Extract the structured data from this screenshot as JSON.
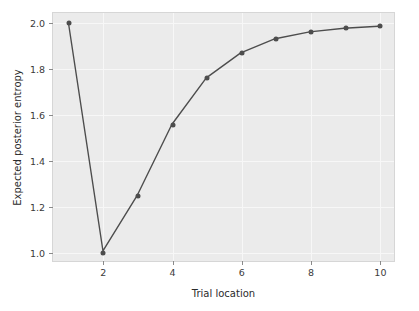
{
  "chart_data": {
    "type": "line",
    "title": "",
    "xlabel": "Trial location",
    "ylabel": "Expected posterior entropy",
    "x": [
      1,
      2,
      3,
      4,
      5,
      6,
      7,
      8,
      9,
      10
    ],
    "values": [
      2.0,
      1.0,
      1.245,
      1.555,
      1.76,
      1.87,
      1.932,
      1.962,
      1.978,
      1.987
    ],
    "series": [
      {
        "name": "Expected posterior entropy",
        "values": [
          2.0,
          1.0,
          1.245,
          1.555,
          1.76,
          1.87,
          1.932,
          1.962,
          1.978,
          1.987
        ]
      }
    ],
    "xlim": [
      0.55,
      10.45
    ],
    "ylim": [
      0.955,
      2.045
    ],
    "xticks": [
      2,
      4,
      6,
      8,
      10
    ],
    "xticklabels": [
      "2",
      "4",
      "6",
      "8",
      "10"
    ],
    "yticks": [
      1.0,
      1.2,
      1.4,
      1.6,
      1.8,
      2.0
    ],
    "yticklabels": [
      "1.0",
      "1.2",
      "1.4",
      "1.6",
      "1.8",
      "2.0"
    ],
    "grid": true,
    "legend": null,
    "marker": "circle",
    "line_color": "#4d4d4d",
    "marker_color": "#4d4d4d",
    "axes_facecolor": "#ebebeb",
    "grid_color": "#f7f7f7",
    "figure_facecolor": "#ffffff"
  }
}
